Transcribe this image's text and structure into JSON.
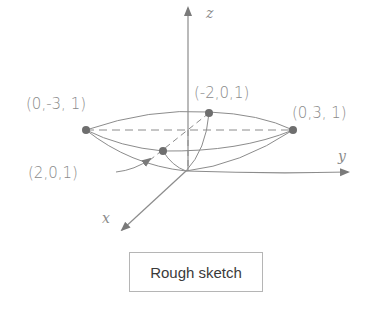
{
  "diagram": {
    "axes": {
      "z_label": "z",
      "y_label": "y",
      "x_label": "x"
    },
    "points": [
      {
        "id": "left",
        "label": "(0,-3, 1)"
      },
      {
        "id": "back",
        "label": "(-2,0,1)"
      },
      {
        "id": "right",
        "label": "(0,3, 1)"
      },
      {
        "id": "front",
        "label": "(2,0,1)"
      }
    ],
    "caption": "Rough sketch",
    "colors": {
      "line": "#8c8c8c",
      "point": "#6e6e6e",
      "text": "#8a8a8a"
    }
  }
}
